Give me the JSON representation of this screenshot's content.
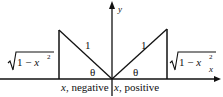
{
  "diagram": {
    "axes": {
      "x_label": "x",
      "y_label": "y"
    },
    "left_triangle": {
      "hypotenuse_label": "1",
      "angle_label": "θ",
      "side_label": "√1 − x²",
      "side_radicand": "1 − x",
      "side_exponent": "2",
      "base_caption": "x, negative"
    },
    "right_triangle": {
      "hypotenuse_label": "1",
      "angle_label": "θ",
      "side_label": "√1 − x²",
      "side_radicand": "1 − x",
      "side_exponent": "2",
      "base_caption": "x, positive"
    },
    "colors": {
      "stroke": "#111111",
      "background": "#ffffff"
    }
  }
}
